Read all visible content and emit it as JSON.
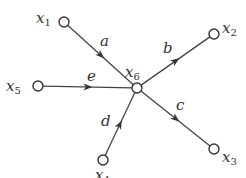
{
  "diagram": {
    "type": "signal-flow-graph",
    "center": {
      "id": "x6",
      "var": "x",
      "sub": "6",
      "cx": 137,
      "cy": 88,
      "lx": 125,
      "ly": 77
    },
    "nodes": [
      {
        "id": "x1",
        "var": "x",
        "sub": "1",
        "cx": 64,
        "cy": 22,
        "lx": 36,
        "ly": 23
      },
      {
        "id": "x2",
        "var": "x",
        "sub": "2",
        "cx": 214,
        "cy": 34,
        "lx": 222,
        "ly": 33
      },
      {
        "id": "x3",
        "var": "x",
        "sub": "3",
        "cx": 214,
        "cy": 149,
        "lx": 222,
        "ly": 162
      },
      {
        "id": "x4",
        "var": "x",
        "sub": "4",
        "cx": 103,
        "cy": 160,
        "lx": 95,
        "ly": 180
      },
      {
        "id": "x5",
        "var": "x",
        "sub": "5",
        "cx": 38,
        "cy": 86,
        "lx": 6,
        "ly": 91
      }
    ],
    "edges": [
      {
        "id": "a",
        "label": "a",
        "from": "x1",
        "to": "x6",
        "lx": 100,
        "ly": 46
      },
      {
        "id": "b",
        "label": "b",
        "from": "x6",
        "to": "x2",
        "lx": 163,
        "ly": 53
      },
      {
        "id": "c",
        "label": "c",
        "from": "x6",
        "to": "x3",
        "lx": 176,
        "ly": 110
      },
      {
        "id": "d",
        "label": "d",
        "from": "x4",
        "to": "x6",
        "lx": 101,
        "ly": 126
      },
      {
        "id": "e",
        "label": "e",
        "from": "x5",
        "to": "x6",
        "lx": 87,
        "ly": 81
      }
    ]
  }
}
